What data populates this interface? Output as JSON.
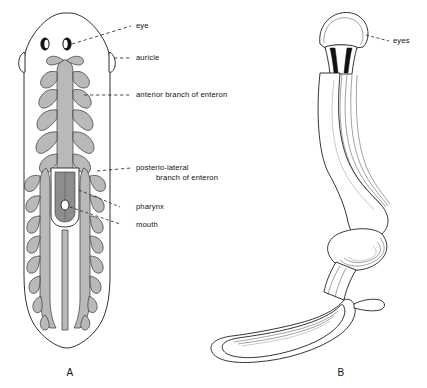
{
  "plate": {
    "title": "Planarian anatomy plate",
    "background_color": "#ffffff",
    "ink_color": "#1a1a1a",
    "gut_fill_color": "#b9b9b9"
  },
  "figures": [
    {
      "caption": "A",
      "name": "planarian-dorsal-view",
      "description": "Dorsal view of planarian showing branched enteron"
    },
    {
      "caption": "B",
      "name": "land-planarian-bipalium",
      "description": "Land planarian with fan-shaped head and coiled body"
    }
  ],
  "labels": [
    {
      "id": "eye",
      "text": "eye"
    },
    {
      "id": "auricle",
      "text": "auricle"
    },
    {
      "id": "anterior",
      "text": "anterior branch of enteron"
    },
    {
      "id": "postlat1",
      "text": "posterio-lateral"
    },
    {
      "id": "postlat2",
      "text": "branch of enteron"
    },
    {
      "id": "pharynx",
      "text": "pharynx"
    },
    {
      "id": "mouth",
      "text": "mouth"
    },
    {
      "id": "eyes",
      "text": "eyes"
    }
  ],
  "captions": {
    "figure_a": "A",
    "figure_b": "B"
  }
}
